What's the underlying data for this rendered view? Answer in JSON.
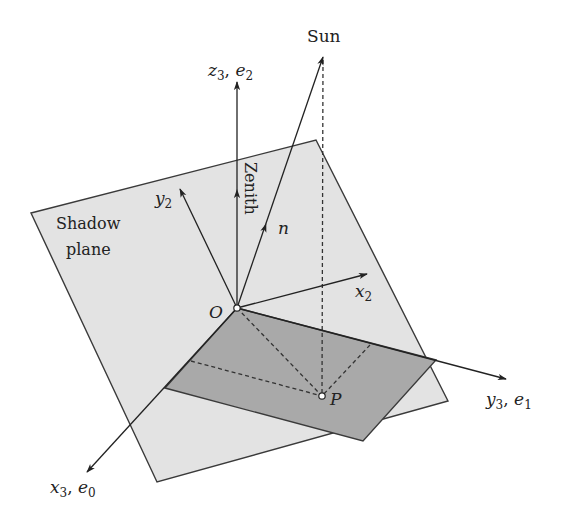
{
  "diagram": {
    "colors": {
      "background": "#ffffff",
      "shadow_plane_fill": "#e3e3e3",
      "shadow_rect_fill": "#a9a9a9",
      "stroke": "#2a2a2a"
    },
    "labels": {
      "sun": "Sun",
      "z3_main": "z",
      "z3_sub": "3",
      "z3_sep": ", ",
      "e2_main": "e",
      "e2_sub": "2",
      "zenith": "Zenith",
      "y2_main": "y",
      "y2_sub": "2",
      "n": "n",
      "shadow_line1": "Shadow",
      "shadow_line2": "plane",
      "x2_main": "x",
      "x2_sub": "2",
      "origin": "O",
      "point_p": "P",
      "y3_main": "y",
      "y3_sub": "3",
      "y3_sep": ", ",
      "e1_main": "e",
      "e1_sub": "1",
      "x3_main": "x",
      "x3_sub": "3",
      "x3_sep": ", ",
      "e0_main": "e",
      "e0_sub": "0"
    },
    "points": {
      "O": [
        237,
        308
      ],
      "P": [
        322,
        396
      ],
      "sun_tip": [
        323,
        57
      ]
    }
  }
}
